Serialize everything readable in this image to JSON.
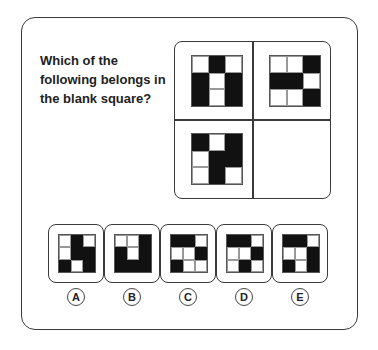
{
  "question": "Which of the following belongs in the blank square?",
  "puzzle": {
    "cells": [
      {
        "position": "top-left",
        "pattern": [
          [
            0,
            1,
            0
          ],
          [
            1,
            0,
            1
          ],
          [
            1,
            0,
            1
          ]
        ]
      },
      {
        "position": "top-right",
        "pattern": [
          [
            0,
            0,
            1
          ],
          [
            1,
            1,
            0
          ],
          [
            0,
            0,
            1
          ]
        ]
      },
      {
        "position": "bottom-left",
        "pattern": [
          [
            1,
            0,
            1
          ],
          [
            0,
            1,
            1
          ],
          [
            0,
            1,
            0
          ]
        ]
      },
      {
        "position": "bottom-right",
        "pattern": null,
        "blank": true
      }
    ]
  },
  "options": [
    {
      "label": "A",
      "pattern": [
        [
          0,
          1,
          0
        ],
        [
          0,
          1,
          1
        ],
        [
          1,
          0,
          1
        ]
      ]
    },
    {
      "label": "B",
      "pattern": [
        [
          0,
          0,
          1
        ],
        [
          1,
          0,
          1
        ],
        [
          1,
          1,
          1
        ]
      ]
    },
    {
      "label": "C",
      "pattern": [
        [
          1,
          1,
          0
        ],
        [
          0,
          0,
          1
        ],
        [
          1,
          0,
          0
        ]
      ]
    },
    {
      "label": "D",
      "pattern": [
        [
          1,
          1,
          0
        ],
        [
          0,
          0,
          1
        ],
        [
          0,
          1,
          0
        ]
      ]
    },
    {
      "label": "E",
      "pattern": [
        [
          1,
          1,
          0
        ],
        [
          0,
          0,
          1
        ],
        [
          1,
          0,
          1
        ]
      ]
    }
  ],
  "colors": {
    "filled": "#111111",
    "empty": "#ffffff",
    "border": "#3a3a3a"
  }
}
